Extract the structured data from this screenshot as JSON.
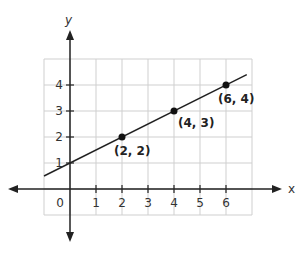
{
  "chart_data": {
    "type": "line",
    "title": "",
    "xlabel": "x",
    "ylabel": "y",
    "xlim": [
      -1,
      6.7
    ],
    "ylim": [
      -1,
      5
    ],
    "grid": true,
    "x_ticks": [
      "1",
      "2",
      "3",
      "4",
      "5",
      "6"
    ],
    "y_ticks": [
      "1",
      "2",
      "3",
      "4"
    ],
    "origin_label": "0",
    "line": {
      "slope": 0.5,
      "intercept": 1,
      "x_range": [
        -1,
        6.8
      ]
    },
    "points": [
      {
        "x": 2,
        "y": 2,
        "label": "(2, 2)"
      },
      {
        "x": 4,
        "y": 3,
        "label": "(4, 3)"
      },
      {
        "x": 6,
        "y": 4,
        "label": "(6, 4)"
      }
    ]
  },
  "colors": {
    "grid": "#cfcfcf",
    "axis": "#222222",
    "line": "#222222"
  }
}
